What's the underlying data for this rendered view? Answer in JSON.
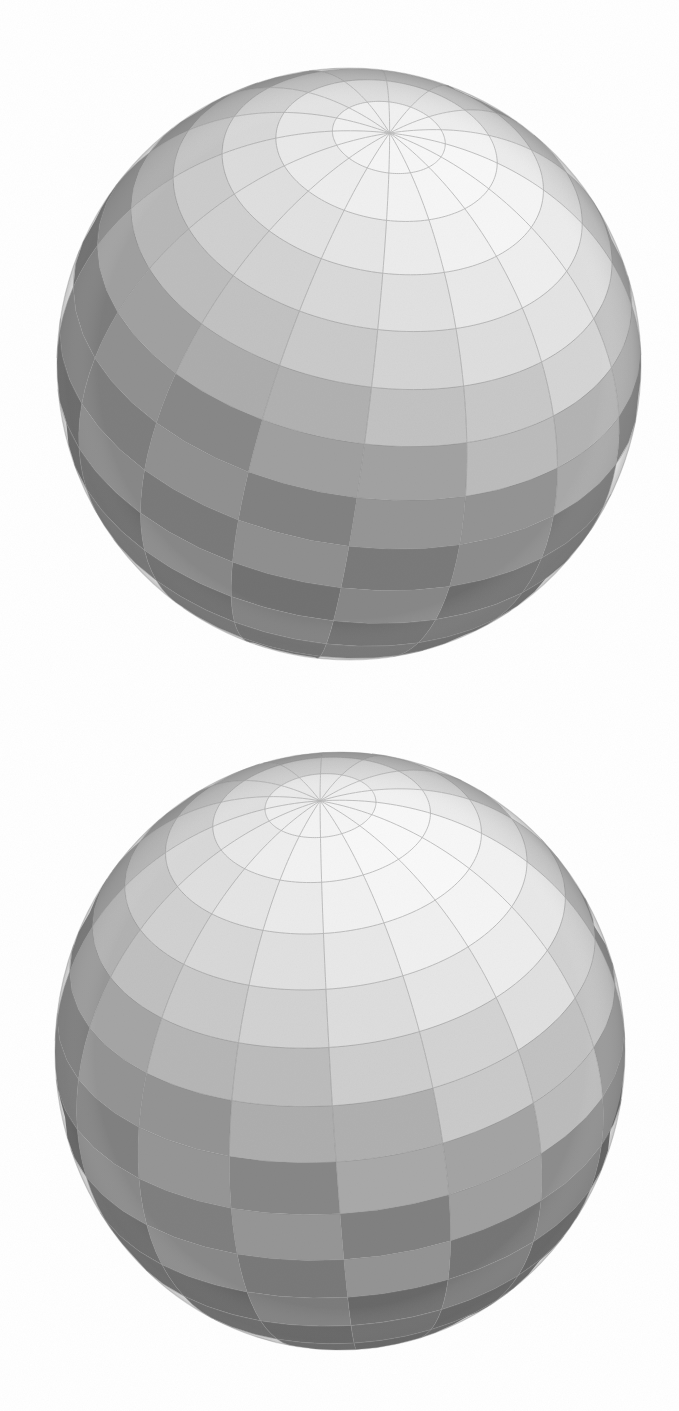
{
  "figure": {
    "title": "Two shaded spheres with checkerboard UV grid",
    "background_color": "#ffffff",
    "canvas": {
      "width": 679,
      "height": 1411
    },
    "style": "grayscale scanned pencil / rendered shading",
    "object_count": 2
  },
  "spheres": [
    {
      "id": "sphere-top",
      "label": "Top sphere",
      "center": {
        "x": 349,
        "y": 364
      },
      "radius_x": 292,
      "radius_y": 296,
      "bounds": {
        "left": 57,
        "top": 68,
        "right": 641,
        "bottom": 660
      },
      "pole": {
        "x": 325,
        "y": 155
      },
      "pole_tilt_deg": 38,
      "pole_rotation_deg": -8,
      "meridian_count": 16,
      "parallel_count": 8,
      "grid_line_color": "#8a8a8a",
      "grid_line_width": 0.9,
      "light_direction": {
        "x": -0.45,
        "y": -0.78,
        "z": 0.44
      },
      "ambient": 0.58,
      "diffuse": 0.42,
      "checker_light": "#ffffff",
      "checker_dark": "#b9b9b9",
      "terminator_shadow": "#8c8c8c",
      "rim_shadow": "#6f6f6f",
      "silhouette_color": "#9a9a9a"
    },
    {
      "id": "sphere-bottom",
      "label": "Bottom sphere",
      "center": {
        "x": 340,
        "y": 1051
      },
      "radius_x": 285,
      "radius_y": 299,
      "bounds": {
        "left": 55,
        "top": 752,
        "right": 625,
        "bottom": 1350
      },
      "pole": {
        "x": 320,
        "y": 842
      },
      "pole_tilt_deg": 33,
      "pole_rotation_deg": 4,
      "meridian_count": 16,
      "parallel_count": 8,
      "grid_line_color": "#8a8a8a",
      "grid_line_width": 0.9,
      "light_direction": {
        "x": -0.3,
        "y": -0.82,
        "z": 0.49
      },
      "ambient": 0.6,
      "diffuse": 0.4,
      "checker_light": "#ffffff",
      "checker_dark": "#bdbdbd",
      "terminator_shadow": "#8f8f8f",
      "rim_shadow": "#5a5a5a",
      "silhouette_color": "#9a9a9a"
    }
  ],
  "chart_data": {
    "type": "other",
    "items": [
      {
        "name": "Top sphere",
        "center_x": 349,
        "center_y": 364,
        "radius": 294,
        "pole_x": 325,
        "pole_y": 155,
        "meridians": 16,
        "parallels": 8,
        "mean_gray_upper": 250,
        "mean_gray_equator": 198,
        "mean_gray_lower": 160
      },
      {
        "name": "Bottom sphere",
        "center_x": 340,
        "center_y": 1051,
        "radius": 292,
        "pole_x": 320,
        "pole_y": 842,
        "meridians": 16,
        "parallels": 8,
        "mean_gray_upper": 252,
        "mean_gray_equator": 210,
        "mean_gray_lower": 150
      }
    ],
    "xlabel": "",
    "ylabel": "",
    "legend": []
  }
}
